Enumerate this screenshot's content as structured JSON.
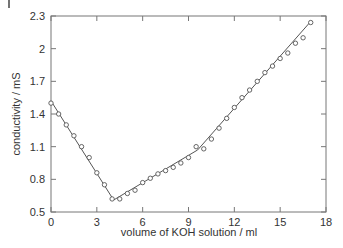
{
  "chart_data": {
    "type": "scatter",
    "title": "",
    "xlabel": "volume of KOH solution / ml",
    "ylabel": "conductivity / mS",
    "xlim": [
      0,
      18
    ],
    "ylim": [
      0.5,
      2.3
    ],
    "xticks": [
      0,
      3,
      6,
      9,
      12,
      15,
      18
    ],
    "yticks": [
      0.5,
      0.8,
      1.1,
      1.4,
      1.7,
      2.0,
      2.3
    ],
    "xtick_labels": [
      "0",
      "3",
      "6",
      "9",
      "12",
      "15",
      "18"
    ],
    "ytick_labels": [
      "0.5",
      "0.8",
      "1.1",
      "1.4",
      "1.7",
      "2",
      "2.3"
    ],
    "grid": false,
    "legend": null,
    "series": [
      {
        "name": "measured",
        "marker": "open-circle",
        "x": [
          0,
          0.5,
          1,
          1.5,
          2,
          2.5,
          3,
          3.5,
          4,
          4.5,
          5,
          5.5,
          6,
          6.5,
          7,
          7.5,
          8,
          8.5,
          9,
          9.5,
          10,
          10.5,
          11,
          11.5,
          12,
          12.5,
          13,
          13.5,
          14,
          14.5,
          15,
          15.5,
          16,
          16.5,
          17
        ],
        "y": [
          1.5,
          1.4,
          1.3,
          1.2,
          1.1,
          1.0,
          0.86,
          0.75,
          0.62,
          0.62,
          0.67,
          0.7,
          0.77,
          0.81,
          0.85,
          0.88,
          0.91,
          0.95,
          1.0,
          1.1,
          1.08,
          1.17,
          1.27,
          1.36,
          1.46,
          1.55,
          1.62,
          1.7,
          1.78,
          1.84,
          1.91,
          1.96,
          2.05,
          2.1,
          2.24
        ]
      },
      {
        "name": "fit",
        "marker": "line",
        "x": [
          0,
          4.1,
          9.6,
          17
        ],
        "y": [
          1.52,
          0.61,
          1.07,
          2.25
        ]
      }
    ]
  },
  "colors": {
    "axis": "#666666",
    "line": "#555555",
    "marker": "#555555",
    "text": "#333333"
  }
}
